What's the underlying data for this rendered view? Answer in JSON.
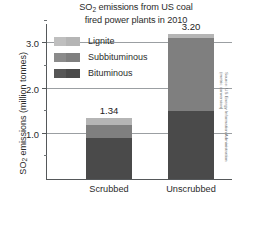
{
  "chart_data": {
    "type": "bar",
    "title": "SO2 emissions from US coal fired power plants in 2010",
    "title_line1_pre": "SO",
    "title_line1_sub": "2",
    "title_line1_post": " emissions from US coal",
    "title_line2": "fired power plants in 2010",
    "xlabel": "",
    "ylabel": "SO2 emissions (million tonnes)",
    "ylabel_pre": "SO",
    "ylabel_sub": "2",
    "ylabel_post": " emissions (million tonnes)",
    "categories": [
      "Scrubbed",
      "Unscrubbed"
    ],
    "totals": [
      1.34,
      3.2
    ],
    "total_labels": [
      "1.34",
      "3.20"
    ],
    "stacked": true,
    "series": [
      {
        "name": "Bituminous",
        "color": "#4a4a4a",
        "color_alt": "#565656",
        "values": [
          0.9,
          1.5
        ]
      },
      {
        "name": "Subbituminous",
        "color": "#7f7f7f",
        "color_alt": "#8b8b8b",
        "values": [
          0.3,
          1.62
        ]
      },
      {
        "name": "Lignite",
        "color": "#b5b5b5",
        "color_alt": "#bfbfbf",
        "values": [
          0.14,
          0.08
        ]
      }
    ],
    "legend_order": [
      "Lignite",
      "Subbituminous",
      "Bituminous"
    ],
    "legend_position": "inside-upper-left",
    "ylim": [
      0,
      3.45
    ],
    "yticks_major": [
      1.0,
      2.0,
      3.0
    ],
    "ytick_labels": [
      "1.0",
      "2.0",
      "3.0"
    ],
    "yticks_minor": [
      0.5,
      1.5,
      2.5,
      3.5
    ],
    "grid": true,
    "grid_axis": "y",
    "source_note": "Source: US Energy Information Administration (metric conversion)",
    "source_line1": "Source: US Energy Information Administration",
    "source_line2": "(metric conversion)"
  }
}
